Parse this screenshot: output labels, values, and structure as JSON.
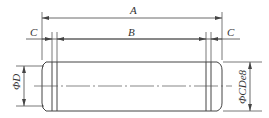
{
  "drawing": {
    "type": "pin-part-drawing",
    "dimensions": {
      "overall_length": "A",
      "middle_length": "B",
      "end_length_left": "C",
      "end_length_right": "C",
      "groove_diameter": "ΦD",
      "shaft_diameter": "ΦCDe8"
    },
    "colors": {
      "line": "#555555",
      "background": "#ffffff"
    }
  }
}
